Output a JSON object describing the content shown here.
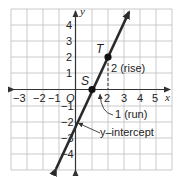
{
  "graph": {
    "x_axis_label": "x",
    "y_axis_label": "y",
    "origin_label": "O",
    "x_ticks": [
      {
        "value": -3,
        "label": "−3"
      },
      {
        "value": -2,
        "label": "−2"
      },
      {
        "value": -1,
        "label": "−1"
      },
      {
        "value": 2,
        "label": "2"
      },
      {
        "value": 3,
        "label": "3"
      },
      {
        "value": 4,
        "label": "4"
      },
      {
        "value": 5,
        "label": "5"
      }
    ],
    "y_ticks": [
      {
        "value": 4,
        "label": "4"
      },
      {
        "value": 3,
        "label": "3"
      },
      {
        "value": 2,
        "label": "2"
      },
      {
        "value": 1,
        "label": "1"
      },
      {
        "value": -1,
        "label": "−1"
      },
      {
        "value": -2,
        "label": "−2"
      },
      {
        "value": -3,
        "label": "−3"
      },
      {
        "value": -4,
        "label": "−4"
      }
    ],
    "points": {
      "S": {
        "label": "S",
        "x": 1,
        "y": 0
      },
      "T": {
        "label": "T",
        "x": 2,
        "y": 2
      }
    },
    "annotations": {
      "rise": "2 (rise)",
      "run": "1 (run)",
      "intercept": "y–intercept"
    },
    "line": {
      "slope": 2,
      "intercept": -2,
      "equation": "y = 2x − 2"
    },
    "grid": {
      "xmin": -4,
      "xmax": 6,
      "ymin": -5,
      "ymax": 5
    }
  },
  "colors": {
    "grid": "#b8b8b8",
    "axis": "#333333",
    "line": "#2a2a2a",
    "background": "#ffffff"
  }
}
